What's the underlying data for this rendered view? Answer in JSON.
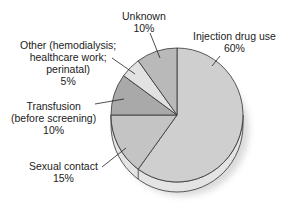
{
  "chart_data": {
    "type": "pie",
    "title": "",
    "style": "3d-pie",
    "categories": [
      "Injection drug use",
      "Sexual contact",
      "Transfusion (before screening)",
      "Other (hemodialysis; healthcare work; perinatal)",
      "Unknown"
    ],
    "values": [
      60,
      15,
      10,
      5,
      10
    ],
    "unit": "%",
    "colors": [
      "#cfcfcf",
      "#c4c4c4",
      "#a9a9a9",
      "#e2e2e2",
      "#b9b9b9"
    ],
    "legend": "none (callout labels)",
    "annotations": [
      {
        "label": "Injection drug use",
        "value": "60%"
      },
      {
        "label": "Sexual contact",
        "value": "15%"
      },
      {
        "label": "Transfusion (before screening)",
        "value": "10%"
      },
      {
        "label": "Other (hemodialysis; healthcare work; perinatal)",
        "value": "5%"
      },
      {
        "label": "Unknown",
        "value": "10%"
      }
    ]
  },
  "labels": {
    "injection": {
      "line1": "Injection drug use",
      "pct": "60%"
    },
    "sexual": {
      "line1": "Sexual contact",
      "pct": "15%"
    },
    "transfusion": {
      "line1": "Transfusion",
      "line2": "(before screening)",
      "pct": "10%"
    },
    "other": {
      "line1": "Other (hemodialysis;",
      "line2": "healthcare work;",
      "line3": "perinatal)",
      "pct": "5%"
    },
    "unknown": {
      "line1": "Unknown",
      "pct": "10%"
    }
  }
}
